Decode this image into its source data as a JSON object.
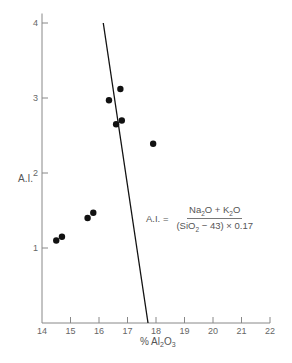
{
  "chart_data": {
    "type": "scatter",
    "title": "",
    "xlabel": "% Al2O3",
    "ylabel": "A.I.",
    "xlim": [
      14,
      22
    ],
    "ylim": [
      0,
      4.1
    ],
    "xticks": [
      14,
      15,
      16,
      17,
      18,
      19,
      20,
      21,
      22
    ],
    "yticks": [
      1,
      2,
      3,
      4
    ],
    "grid": false,
    "legend": null,
    "series": [
      {
        "name": "samples",
        "points": [
          {
            "x": 14.5,
            "y": 1.1
          },
          {
            "x": 14.7,
            "y": 1.15
          },
          {
            "x": 15.6,
            "y": 1.4
          },
          {
            "x": 15.8,
            "y": 1.47
          },
          {
            "x": 16.35,
            "y": 2.97
          },
          {
            "x": 16.75,
            "y": 3.12
          },
          {
            "x": 16.6,
            "y": 2.65
          },
          {
            "x": 16.8,
            "y": 2.7
          },
          {
            "x": 17.9,
            "y": 2.39
          }
        ]
      }
    ],
    "reference_line": {
      "x1": 16.15,
      "y1": 4.0,
      "x2": 17.72,
      "y2": 0.0
    },
    "annotation": {
      "lhs": "A.I. =",
      "numerator": "Na2O + K2O",
      "denominator": "(SiO2 − 43) × 0.17"
    }
  },
  "labels": {
    "ylabel": "A.I.",
    "xlabel_prefix": "% Al",
    "xlabel_sub1": "2",
    "xlabel_mid": "O",
    "xlabel_sub2": "3",
    "formula_lhs": "A.I. =",
    "num_na": "Na",
    "num_sub": "2",
    "num_rest": "O + K",
    "num_sub2": "2",
    "num_end": "O",
    "den_a": "(SiO",
    "den_sub": "2",
    "den_b": " − 43) × 0.17"
  }
}
